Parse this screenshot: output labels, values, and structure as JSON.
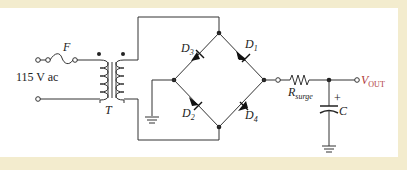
{
  "diagram": {
    "type": "full-wave bridge rectifier with filter",
    "colors": {
      "background": "#f3ecce",
      "panel": "#ffffff",
      "wire": "#333333",
      "output_label": "#b03a3a"
    },
    "labels": {
      "fuse": "F",
      "input": "115 V ac",
      "transformer": "T",
      "d1": "D",
      "d1_sub": "1",
      "d2": "D",
      "d2_sub": "2",
      "d3": "D",
      "d3_sub": "3",
      "d4": "D",
      "d4_sub": "4",
      "resistor": "R",
      "resistor_sub": "surge",
      "capacitor": "C",
      "cap_plus": "+",
      "output": "V",
      "output_sub": "OUT"
    },
    "components": [
      "fuse",
      "transformer",
      "D1",
      "D2",
      "D3",
      "D4",
      "R_surge",
      "C",
      "ground",
      "ground"
    ]
  }
}
